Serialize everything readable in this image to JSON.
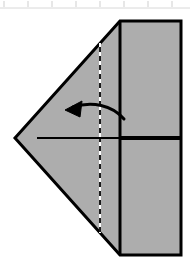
{
  "figure": {
    "canvas": {
      "width": 190,
      "height": 268,
      "background": "#ffffff"
    },
    "ruler": {
      "label": "ruler-strip",
      "line_color": "#d8d8d8",
      "baseline_y": 8,
      "tick_color": "#cccccc",
      "tick_positions": [
        4,
        28,
        52,
        76,
        100,
        124,
        148,
        172
      ],
      "tick_top": 0,
      "tick_bottom": 7
    },
    "colors": {
      "paper_fill": "#adadad",
      "outline": "#000000",
      "crease_solid": "#000000",
      "fold_dash_dark": "#1a1a1a",
      "fold_dash_light": "#ffffff",
      "arrow": "#000000",
      "center_line": "#000000"
    },
    "shape": {
      "name": "paper-outline",
      "description": "pentagon: rectangle with left-pointing triangular flap",
      "points": "15,138 120,21 181,21 181,255 120,255",
      "stroke_width": 3
    },
    "creases": [
      {
        "name": "vertical-crease-solid",
        "type": "solid",
        "x": 120,
        "y1": 21,
        "y2": 255,
        "stroke_width": 3
      },
      {
        "name": "vertical-fold-dashed",
        "type": "dashed",
        "x": 100,
        "y1": 43,
        "y2": 233,
        "stroke_width": 2,
        "dash": "5 4"
      },
      {
        "name": "horizontal-center-line-thin",
        "type": "solid",
        "x1": 37,
        "x2": 120,
        "y": 138,
        "stroke_width": 2
      },
      {
        "name": "horizontal-center-line-thick",
        "type": "solid",
        "x1": 119,
        "x2": 181,
        "y": 138,
        "stroke_width": 4
      }
    ],
    "arrow": {
      "name": "fold-direction-arrow",
      "direction": "right-to-left",
      "path": "M 124,119 C 112,105 92,101 73,107",
      "stroke_width": 3,
      "head_points": "65,110 82,101 80,117",
      "label": ""
    }
  }
}
